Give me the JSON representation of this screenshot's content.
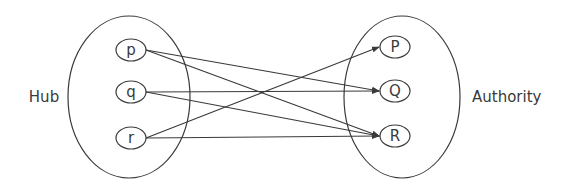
{
  "diagram": {
    "colors": {
      "stroke": "#3a3a3a",
      "background": "#ffffff",
      "text": "#3a3a3a"
    },
    "groups": [
      {
        "id": "hub",
        "label": "Hub",
        "cx": 129,
        "cy": 97,
        "rx": 61,
        "ry": 81,
        "label_x": 44,
        "label_y": 102,
        "anchor": "middle"
      },
      {
        "id": "authority",
        "label": "Authority",
        "cx": 402,
        "cy": 97,
        "rx": 58,
        "ry": 81,
        "label_x": 472,
        "label_y": 102,
        "anchor": "start"
      }
    ],
    "nodes": [
      {
        "id": "p",
        "label": "p",
        "group": "hub",
        "cx": 131,
        "cy": 50
      },
      {
        "id": "q",
        "label": "q",
        "group": "hub",
        "cx": 131,
        "cy": 92
      },
      {
        "id": "r",
        "label": "r",
        "group": "hub",
        "cx": 131,
        "cy": 138
      },
      {
        "id": "P",
        "label": "P",
        "group": "authority",
        "cx": 395,
        "cy": 47
      },
      {
        "id": "Q",
        "label": "Q",
        "group": "authority",
        "cx": 395,
        "cy": 91
      },
      {
        "id": "R",
        "label": "R",
        "group": "authority",
        "cx": 395,
        "cy": 136
      }
    ],
    "node_rx": 15,
    "node_ry": 11,
    "edges": [
      {
        "from": "p",
        "to": "Q"
      },
      {
        "from": "p",
        "to": "R"
      },
      {
        "from": "q",
        "to": "Q"
      },
      {
        "from": "q",
        "to": "R"
      },
      {
        "from": "r",
        "to": "P"
      },
      {
        "from": "r",
        "to": "R"
      }
    ]
  }
}
